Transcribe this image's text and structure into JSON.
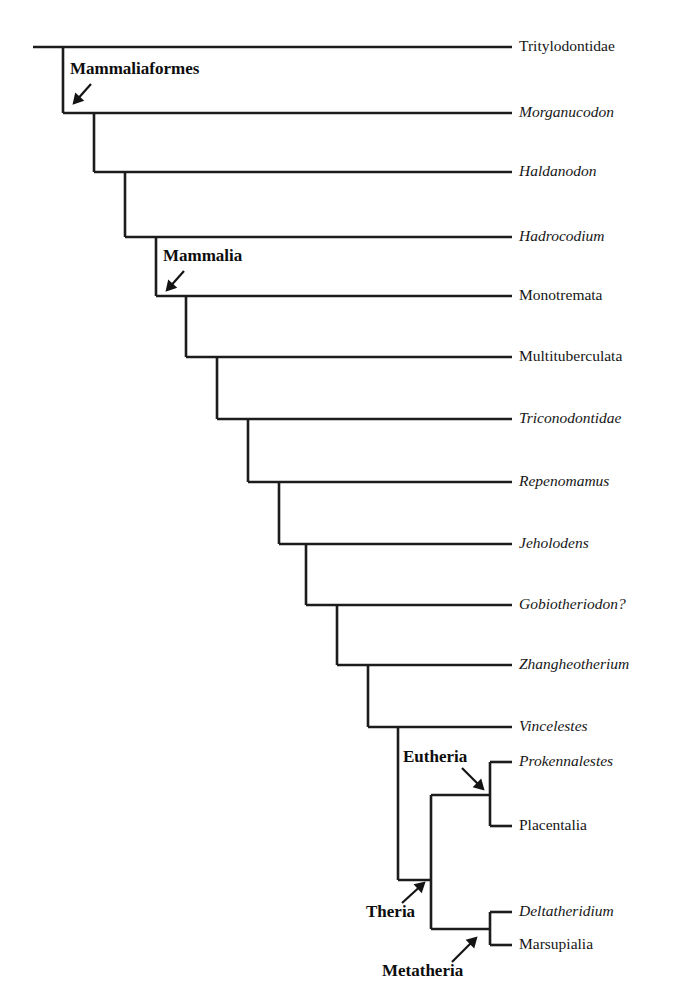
{
  "figure": {
    "type": "cladogram",
    "title": "",
    "background_color": "#ffffff",
    "line_color": "#1c1c1c",
    "text_color": "#161616"
  },
  "tips": [
    {
      "label": "Tritylodontidae",
      "italic": false,
      "y": 47,
      "branch_x": 33
    },
    {
      "label": "Morganucodon",
      "italic": true,
      "y": 113,
      "branch_x": 63
    },
    {
      "label": "Haldanodon",
      "italic": true,
      "y": 172,
      "branch_x": 94
    },
    {
      "label": "Hadrocodium",
      "italic": true,
      "y": 237,
      "branch_x": 125
    },
    {
      "label": "Monotremata",
      "italic": false,
      "y": 296,
      "branch_x": 156
    },
    {
      "label": "Multituberculata",
      "italic": false,
      "y": 357,
      "branch_x": 186
    },
    {
      "label": "Triconodontidae",
      "italic": true,
      "y": 419,
      "branch_x": 217
    },
    {
      "label": "Repenomamus",
      "italic": true,
      "y": 482,
      "branch_x": 248
    },
    {
      "label": "Jeholodens",
      "italic": true,
      "y": 544,
      "branch_x": 279
    },
    {
      "label": "Gobiotheriodon?",
      "italic": true,
      "y": 605,
      "branch_x": 306
    },
    {
      "label": "Zhangheotherium",
      "italic": true,
      "y": 665,
      "branch_x": 337
    },
    {
      "label": "Vincelestes",
      "italic": true,
      "y": 727,
      "branch_x": 368
    },
    {
      "label": "Prokennalestes",
      "italic": true,
      "y": 762,
      "branch_x": 490
    },
    {
      "label": "Placentalia",
      "italic": false,
      "y": 826,
      "branch_x": 490
    },
    {
      "label": "Deltatheridium",
      "italic": true,
      "y": 912,
      "branch_x": 490
    },
    {
      "label": "Marsupialia",
      "italic": false,
      "y": 945,
      "branch_x": 490
    }
  ],
  "geometry": {
    "tip_line_end_x": 512,
    "label_x": 519,
    "root_start_x": 33,
    "ladder_nodes_x": [
      63,
      94,
      125,
      156,
      186,
      217,
      248,
      279,
      306,
      337,
      368,
      398
    ],
    "theria_node_x": 431,
    "subclade_node_x": 490,
    "eutheria_node_y": 795,
    "metatheria_node_y": 929,
    "theria_node_y": 880
  },
  "clade_labels": [
    {
      "name": "Mammaliaformes",
      "text_x": 70,
      "text_y": 70,
      "anchor": "start",
      "arrow": {
        "x1": 91,
        "y1": 84,
        "x2": 74,
        "y2": 103
      }
    },
    {
      "name": "Mammalia",
      "text_x": 163,
      "text_y": 257,
      "anchor": "start",
      "arrow": {
        "x1": 184,
        "y1": 271,
        "x2": 167,
        "y2": 290
      }
    },
    {
      "name": "Eutheria",
      "text_x": 403,
      "text_y": 758,
      "anchor": "start",
      "arrow": {
        "x1": 462,
        "y1": 768,
        "x2": 483,
        "y2": 789
      }
    },
    {
      "name": "Theria",
      "text_x": 366,
      "text_y": 913,
      "anchor": "start",
      "arrow": {
        "x1": 402,
        "y1": 903,
        "x2": 424,
        "y2": 883
      }
    },
    {
      "name": "Metatheria",
      "text_x": 382,
      "text_y": 972,
      "anchor": "start",
      "arrow": {
        "x1": 452,
        "y1": 962,
        "x2": 476,
        "y2": 938
      }
    }
  ],
  "chart_data": {
    "type": "tree",
    "title": "",
    "taxa": [
      "Tritylodontidae",
      "Morganucodon",
      "Haldanodon",
      "Hadrocodium",
      "Monotremata",
      "Multituberculata",
      "Triconodontidae",
      "Repenomamus",
      "Jeholodens",
      "Gobiotheriodon?",
      "Zhangheotherium",
      "Vincelestes",
      "Prokennalestes",
      "Placentalia",
      "Deltatheridium",
      "Marsupialia"
    ],
    "named_clades": [
      "Mammaliaformes",
      "Mammalia",
      "Eutheria",
      "Theria",
      "Metatheria"
    ],
    "newick": "(Tritylodontidae,(Morganucodon,(Haldanodon,(Hadrocodium,(Monotremata,(Multituberculata,(Triconodontidae,(Repenomamus,(Jeholodens,(Gobiotheriodon?,(Zhangheotherium,(Vincelestes,((Prokennalestes,Placentalia)Eutheria,(Deltatheridium,Marsupialia)Metatheria)Theria)))))))))))));",
    "topology": "pectinate ladder with terminal Theria split into Eutheria and Metatheria"
  }
}
